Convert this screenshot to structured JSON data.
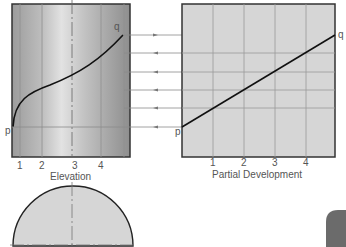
{
  "elevation": {
    "caption": "Elevation",
    "ticks": [
      "1",
      "2",
      "3",
      "4"
    ],
    "point_start": "p",
    "point_end": "q"
  },
  "development": {
    "caption": "Partial Development",
    "ticks": [
      "1",
      "2",
      "3",
      "4"
    ],
    "point_start": "p",
    "point_end": "q"
  },
  "colors": {
    "panel_fill": "#d6d6d6",
    "frame": "#333333",
    "grid": "#9a9a9a",
    "curve": "#111111",
    "projector": "#8a8a8a",
    "corner_tab": "#6b6b6b"
  }
}
